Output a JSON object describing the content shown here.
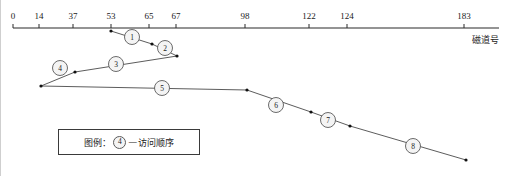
{
  "figure": {
    "title_visible": false,
    "axis": {
      "caption": "磁道号",
      "orientation": "horizontal",
      "line": {
        "x1": 12,
        "x2": 498,
        "y": 28
      },
      "range": [
        0,
        200
      ],
      "ticks": [
        {
          "label": "0",
          "value": 0,
          "x": 12
        },
        {
          "label": "14",
          "value": 14,
          "x": 38
        },
        {
          "label": "37",
          "value": 37,
          "x": 72
        },
        {
          "label": "53",
          "value": 53,
          "x": 110
        },
        {
          "label": "65",
          "value": 65,
          "x": 148
        },
        {
          "label": "67",
          "value": 67,
          "x": 175
        },
        {
          "label": "98",
          "value": 98,
          "x": 244
        },
        {
          "label": "122",
          "value": 122,
          "x": 308
        },
        {
          "label": "124",
          "value": 124,
          "x": 346
        },
        {
          "label": "183",
          "value": 183,
          "x": 463
        }
      ]
    },
    "legend": {
      "prefix": "图例：",
      "badge": "4",
      "dash": "—",
      "description": "访问顺序",
      "box": {
        "x": 57,
        "y": 129,
        "width": 142,
        "height": 26
      }
    },
    "colors": {
      "axis": "#2b2b2b",
      "path": "#4a4a4a",
      "marker": "#111111",
      "circle_fill": "#f4f4f4",
      "circle_stroke": "#5a5a5a",
      "legend_border": "#3a3a3a",
      "background": "#ffffff"
    }
  },
  "chart_data": {
    "type": "line",
    "title": "",
    "xlabel": "磁道号",
    "ylabel": "",
    "xlim": [
      0,
      200
    ],
    "grid": false,
    "legend": "图例：4 — 访问顺序",
    "x": [
      53,
      65,
      67,
      37,
      14,
      98,
      122,
      124,
      183
    ],
    "y": [
      0,
      1,
      2,
      3,
      4,
      5,
      6,
      7,
      8
    ],
    "points": [
      {
        "order": 0,
        "track": 53,
        "px": 110,
        "py": 31,
        "label": ""
      },
      {
        "order": 1,
        "track": 65,
        "px": 151,
        "py": 44,
        "label": "1"
      },
      {
        "order": 2,
        "track": 67,
        "px": 176,
        "py": 56,
        "label": "2"
      },
      {
        "order": 3,
        "track": 37,
        "px": 74,
        "py": 72,
        "label": "3"
      },
      {
        "order": 4,
        "track": 14,
        "px": 40,
        "py": 86,
        "label": "4"
      },
      {
        "order": 5,
        "track": 98,
        "px": 246,
        "py": 90,
        "label": "5"
      },
      {
        "order": 6,
        "track": 122,
        "px": 310,
        "py": 112,
        "label": "6"
      },
      {
        "order": 7,
        "track": 124,
        "px": 349,
        "py": 126,
        "label": "7"
      },
      {
        "order": 8,
        "track": 183,
        "px": 465,
        "py": 160,
        "label": "8"
      }
    ],
    "segments": [
      {
        "from": 53,
        "to": 65,
        "step": "1"
      },
      {
        "from": 65,
        "to": 67,
        "step": "2"
      },
      {
        "from": 67,
        "to": 37,
        "step": "3"
      },
      {
        "from": 37,
        "to": 14,
        "step": "4"
      },
      {
        "from": 14,
        "to": 98,
        "step": "5"
      },
      {
        "from": 98,
        "to": 122,
        "step": "6"
      },
      {
        "from": 122,
        "to": 124,
        "step": "7"
      },
      {
        "from": 124,
        "to": 183,
        "step": "8"
      }
    ],
    "step_circles": [
      {
        "label": "1",
        "cx": 131,
        "cy": 37,
        "r": 7.5
      },
      {
        "label": "2",
        "cx": 164,
        "cy": 48,
        "r": 7.5
      },
      {
        "label": "3",
        "cx": 115,
        "cy": 64,
        "r": 7.5
      },
      {
        "label": "4",
        "cx": 59,
        "cy": 68,
        "r": 7.5
      },
      {
        "label": "5",
        "cx": 161,
        "cy": 88,
        "r": 7.5
      },
      {
        "label": "6",
        "cx": 275,
        "cy": 105,
        "r": 7.5
      },
      {
        "label": "7",
        "cx": 327,
        "cy": 120,
        "r": 7.5
      },
      {
        "label": "8",
        "cx": 412,
        "cy": 146,
        "r": 7.5
      }
    ]
  }
}
